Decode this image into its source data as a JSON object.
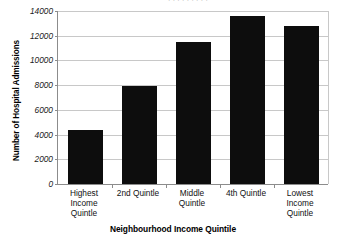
{
  "chart_data": {
    "type": "bar",
    "title": "",
    "xlabel": "Neighbourhood Income Quintile",
    "ylabel": "Number of Hospital Admissions",
    "categories": [
      "Highest Income Quintile",
      "2nd Quintle",
      "Middle Quintle",
      "4th Quintle",
      "Lowest Income Quintile"
    ],
    "category_lines": [
      [
        "Highest",
        "Income",
        "Quintle"
      ],
      [
        "2nd Quintle"
      ],
      [
        "Middle",
        "Quintle"
      ],
      [
        "4th Quintle"
      ],
      [
        "Lowest",
        "Income",
        "Quintle"
      ]
    ],
    "values": [
      4400,
      7900,
      11500,
      13600,
      12800
    ],
    "ylim": [
      0,
      14000
    ],
    "ytick_values": [
      0,
      2000,
      4000,
      6000,
      8000,
      10000,
      12000,
      14000
    ],
    "ytick_labels": [
      "0",
      "2000",
      "4000",
      "6000",
      "8000",
      "10000",
      "12000",
      "14000"
    ],
    "grid": true,
    "legend": false,
    "bar_color": "#0d0d0d",
    "gridline_color": "#c8c8c8",
    "axis_color": "#8c8c8c"
  },
  "axes": {
    "y_title": "Number of Hospital Admissions",
    "x_title": "Neighbourhood Income Quintile"
  },
  "clipped_header": {
    "text": "· ·  ·    · ·   ·   · · ·"
  }
}
